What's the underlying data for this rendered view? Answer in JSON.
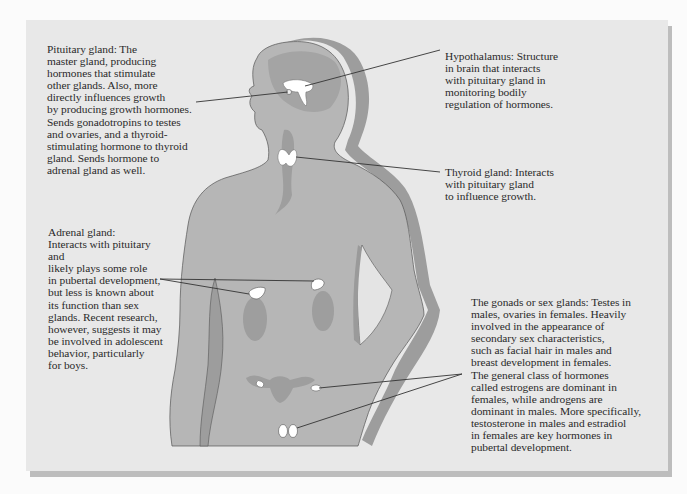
{
  "diagram": {
    "type": "anatomical-illustration",
    "colors": {
      "page_background": "#fbfbfb",
      "panel_background": "#e8e8e8",
      "panel_shadow": "#bdbdbd",
      "body_fill": "#b4b4b4",
      "body_shadow": "#9a9a9a",
      "organ_shade": "#9e9e9e",
      "gland_fill": "#ffffff",
      "leader_line": "#333333",
      "text": "#2a2a2a"
    },
    "labels": [
      {
        "id": "pituitary",
        "title": "Pituitary gland",
        "text": "Pituitary gland:  The\nmaster gland, producing\nhormones that stimulate\nother glands.  Also, more\ndirectly influences growth\nby producing growth hormones.\nSends gonadotropins to testes\nand ovaries, and a thyroid-\nstimulating hormone to thyroid\ngland.  Sends hormone to\nadrenal gland as well."
      },
      {
        "id": "hypothalamus",
        "title": "Hypothalamus",
        "text": "Hypothalamus:  Structure\nin brain that interacts\nwith pituitary gland in\nmonitoring bodily\nregulation of hormones."
      },
      {
        "id": "thyroid",
        "title": "Thyroid gland",
        "text": "Thyroid gland:  Interacts\nwith pituitary gland\nto influence growth."
      },
      {
        "id": "adrenal",
        "title": "Adrenal gland",
        "text": "Adrenal gland:\nInteracts with pituitary and\nlikely plays some role\nin pubertal development,\nbut less is known about\nits function than sex\nglands.  Recent research,\nhowever, suggests it may\nbe involved in adolescent\nbehavior, particularly\nfor boys."
      },
      {
        "id": "gonads",
        "title": "The gonads or sex glands",
        "text": "The gonads or sex glands: Testes in\nmales, ovaries in females.  Heavily\ninvolved in the appearance of\nsecondary sex characteristics,\nsuch as facial hair in males and\nbreast development in females.\nThe general class of hormones\ncalled estrogens are dominant in\nfemales, while androgens are\ndominant in males.  More specifically,\ntestosterone in males and estradiol\nin females are key hormones in\npubertal development."
      }
    ]
  }
}
